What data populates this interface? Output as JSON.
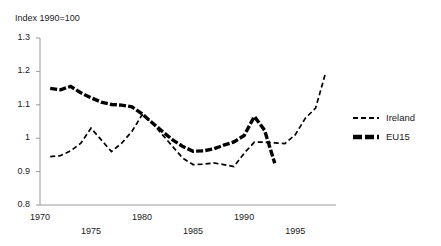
{
  "figure": {
    "clipped_caption_above": "",
    "axis_note": "Index 1990=100"
  },
  "chart_data": {
    "type": "line",
    "title": "",
    "subtitle": "",
    "xlabel": "",
    "ylabel": "Index 1990=100",
    "xlim": [
      1970,
      1999
    ],
    "ylim": [
      0.8,
      1.3
    ],
    "grid": false,
    "legend_position": "right",
    "yticks": [
      "1.3",
      "1.2",
      "1.1",
      "1",
      "0.9",
      "0.8"
    ],
    "ytick_values": [
      1.3,
      1.2,
      1.1,
      1.0,
      0.9,
      0.8
    ],
    "xticks_upper": [
      "1970",
      "1980",
      "1990"
    ],
    "xticks_lower": [
      "1975",
      "1985",
      "1995"
    ],
    "xtick_values_upper": [
      1970,
      1980,
      1990
    ],
    "xtick_values_lower": [
      1975,
      1985,
      1995
    ],
    "series": [
      {
        "name": "Ireland",
        "style": "dashed-thin",
        "color": "#000000",
        "x": [
          1971,
          1972,
          1973,
          1974,
          1975,
          1976,
          1977,
          1978,
          1979,
          1980,
          1981,
          1982,
          1983,
          1984,
          1985,
          1986,
          1987,
          1988,
          1989,
          1990,
          1991,
          1992,
          1993,
          1994,
          1995,
          1996,
          1997,
          1998
        ],
        "values": [
          0.945,
          0.948,
          0.962,
          0.985,
          1.03,
          0.995,
          0.96,
          0.985,
          1.02,
          1.07,
          1.045,
          1.01,
          0.975,
          0.94,
          0.921,
          0.922,
          0.926,
          0.921,
          0.915,
          0.955,
          0.988,
          0.988,
          0.986,
          0.984,
          1.01,
          1.06,
          1.09,
          1.198
        ]
      },
      {
        "name": "EU15",
        "style": "dashed-thick",
        "color": "#000000",
        "x": [
          1971,
          1972,
          1973,
          1974,
          1975,
          1976,
          1977,
          1978,
          1979,
          1980,
          1981,
          1982,
          1983,
          1984,
          1985,
          1986,
          1987,
          1988,
          1989,
          1990,
          1991,
          1992,
          1993
        ],
        "values": [
          1.149,
          1.145,
          1.155,
          1.136,
          1.121,
          1.108,
          1.101,
          1.099,
          1.094,
          1.073,
          1.046,
          1.02,
          0.995,
          0.975,
          0.961,
          0.962,
          0.968,
          0.979,
          0.989,
          1.008,
          1.065,
          1.024,
          0.925
        ]
      }
    ]
  },
  "legend": {
    "items": [
      {
        "label": "Ireland",
        "style": "dashed-thin"
      },
      {
        "label": "EU15",
        "style": "dashed-thick"
      }
    ]
  }
}
